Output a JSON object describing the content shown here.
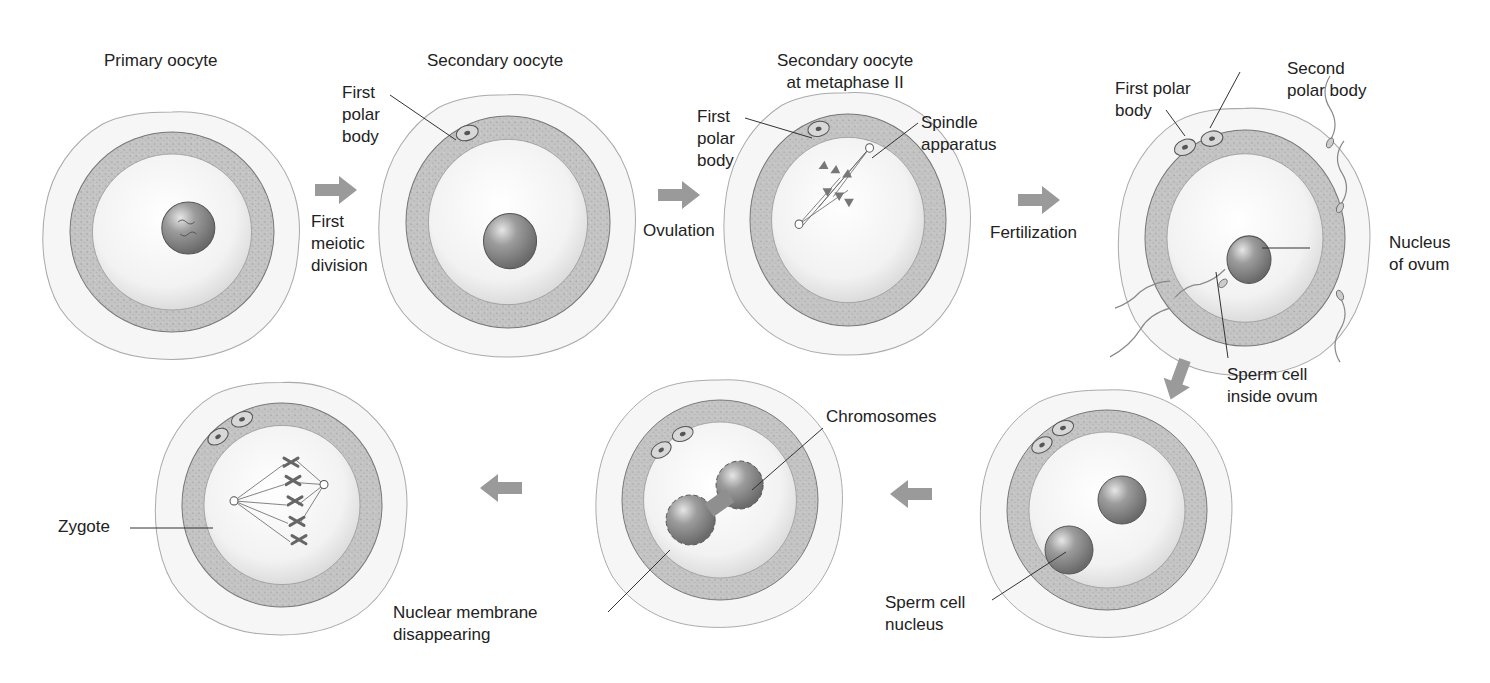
{
  "diagram": {
    "stages": [
      {
        "id": "primary-oocyte",
        "title": "Primary oocyte"
      },
      {
        "id": "secondary-oocyte",
        "title": "Secondary oocyte",
        "labels": {
          "polar_body": "First\npolar\nbody"
        }
      },
      {
        "id": "metaphase-ii",
        "title": "Secondary oocyte\nat metaphase II",
        "labels": {
          "polar_body": "First\npolar\nbody",
          "spindle": "Spindle\napparatus"
        }
      },
      {
        "id": "fertilization",
        "labels": {
          "first_polar": "First polar\nbody",
          "second_polar": "Second\npolar body",
          "nucleus": "Nucleus\nof ovum",
          "sperm_inside": "Sperm cell\ninside ovum"
        }
      },
      {
        "id": "pronuclei",
        "labels": {
          "sperm_nucleus": "Sperm cell\nnucleus"
        }
      },
      {
        "id": "membrane-disappearing",
        "labels": {
          "chromosomes": "Chromosomes",
          "membrane": "Nuclear membrane\ndisappearing"
        }
      },
      {
        "id": "zygote",
        "labels": {
          "zygote": "Zygote"
        }
      }
    ],
    "transitions": [
      {
        "id": "arrow-1",
        "label": "First\nmeiotic\ndivision",
        "direction": "right"
      },
      {
        "id": "arrow-2",
        "label": "Ovulation",
        "direction": "right"
      },
      {
        "id": "arrow-3",
        "label": "Fertilization",
        "direction": "right"
      },
      {
        "id": "arrow-4",
        "label": "",
        "direction": "down-left"
      },
      {
        "id": "arrow-5",
        "label": "",
        "direction": "left"
      },
      {
        "id": "arrow-6",
        "label": "",
        "direction": "left"
      }
    ],
    "colors": {
      "arrow": "#9a9a9a",
      "ring": "#bdbdbd",
      "nucleus": "#8a8a8a",
      "line": "#333333"
    }
  }
}
